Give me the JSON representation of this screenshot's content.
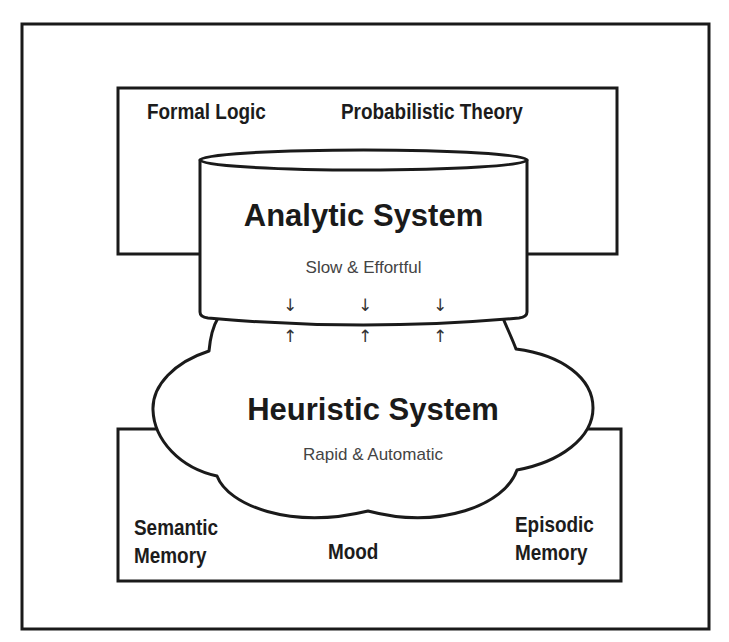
{
  "diagram": {
    "upper_box": {
      "labels": [
        "Formal Logic",
        "Probabilistic Theory"
      ]
    },
    "analytic_system": {
      "title": "Analytic System",
      "subtitle": "Slow & Effortful",
      "shape": "cylinder"
    },
    "heuristic_system": {
      "title": "Heuristic System",
      "subtitle": "Rapid & Automatic",
      "shape": "cloud"
    },
    "interaction_arrows": {
      "count": 3,
      "down_glyph": "↓",
      "up_glyph": "↑"
    },
    "lower_box": {
      "labels": {
        "left_line1": "Semantic",
        "left_line2": "Memory",
        "center": "Mood",
        "right_line1": "Episodic",
        "right_line2": "Memory"
      }
    },
    "colors": {
      "stroke": "#1a1a1a",
      "background": "#ffffff",
      "subtitle_text": "#444444"
    }
  }
}
